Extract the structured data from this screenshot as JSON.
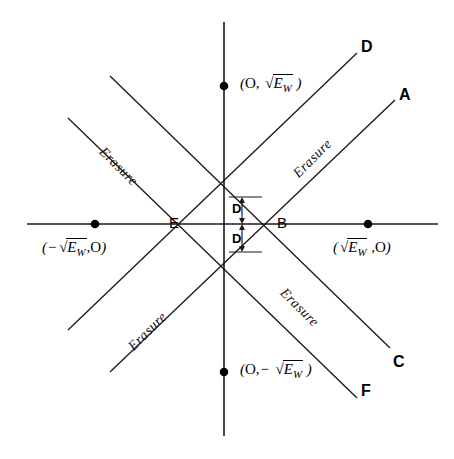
{
  "figure": {
    "type": "geometry-diagram",
    "axes": {
      "x_axis_label": "",
      "y_axis_label": "",
      "origin": [
        224,
        224
      ]
    },
    "points": [
      {
        "name": "top-marker",
        "label_html": "( O, √E_W )",
        "coords": [
          224,
          86
        ]
      },
      {
        "name": "left-marker",
        "label_html": "( -√E_W, O )",
        "coords": [
          95,
          224
        ]
      },
      {
        "name": "right-marker",
        "label_html": "( √E_W, O )",
        "coords": [
          368,
          224
        ]
      },
      {
        "name": "bottom-marker",
        "label_html": "( O, -√E_W )",
        "coords": [
          224,
          372
        ]
      }
    ],
    "vertex_labels": [
      {
        "name": "vertex-E",
        "label": "E",
        "coords": [
          175,
          224
        ]
      },
      {
        "name": "vertex-B",
        "label": "B",
        "coords": [
          272,
          224
        ]
      }
    ],
    "line_end_labels": [
      {
        "name": "line-end-D",
        "label": "D",
        "coords": [
          363,
          47
        ]
      },
      {
        "name": "line-end-A",
        "label": "A",
        "coords": [
          401,
          95
        ]
      },
      {
        "name": "line-end-C",
        "label": "C",
        "coords": [
          395,
          364
        ]
      },
      {
        "name": "line-end-F",
        "label": "F",
        "coords": [
          363,
          393
        ]
      }
    ],
    "dimension_labels": [
      {
        "name": "dimension-D-upper",
        "label": "D"
      },
      {
        "name": "dimension-D-lower",
        "label": "D"
      }
    ],
    "region_labels": [
      {
        "name": "erasure-upper-left",
        "label": "Erasure"
      },
      {
        "name": "erasure-upper-right",
        "label": "Erasure"
      },
      {
        "name": "erasure-lower-left",
        "label": "Erasure"
      },
      {
        "name": "erasure-lower-right",
        "label": "Erasure"
      }
    ],
    "symbols": {
      "radical": "√",
      "E": "E",
      "W": "W",
      "O": "O",
      "minus": "−",
      "comma": ","
    },
    "colors": {
      "stroke": "#1a1a1a",
      "text": "#000000",
      "background": "#ffffff"
    }
  }
}
